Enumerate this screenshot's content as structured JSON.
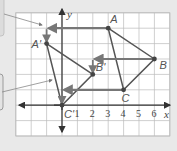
{
  "figure": {
    "type": "coordinate-plane-translation",
    "axes": {
      "x_label": "x",
      "y_label": "y"
    },
    "x_ticks": [
      "1",
      "2",
      "3",
      "4",
      "5",
      "6"
    ],
    "grid": {
      "x_min": -3,
      "x_max": 7,
      "y_min": -2,
      "y_max": 6
    },
    "points": {
      "A": {
        "label": "A",
        "x": 3,
        "y": 5
      },
      "B": {
        "label": "B",
        "x": 6,
        "y": 3
      },
      "C": {
        "label": "C",
        "x": 4,
        "y": 1
      },
      "A_prime": {
        "label": "A'",
        "x": -1,
        "y": 4
      },
      "B_prime": {
        "label": "B'",
        "x": 2,
        "y": 2
      },
      "C_prime": {
        "label": "C'",
        "x": 0,
        "y": 0
      }
    },
    "colors": {
      "background": "#e9e9e9",
      "grid_fill": "#ffffff",
      "grid_line": "#bbbbbb",
      "axis": "#333333",
      "triangle": "#555555",
      "translation_arrow": "#777777",
      "callout": "#999999"
    }
  }
}
